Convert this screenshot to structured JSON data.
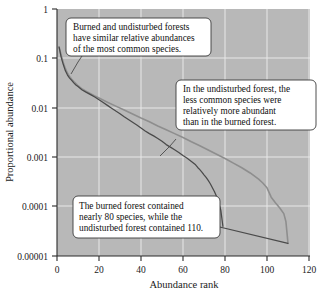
{
  "chart_data": {
    "type": "line",
    "title": "",
    "xlabel": "Abundance rank",
    "ylabel": "Proportional abundance",
    "xlim": [
      0,
      120
    ],
    "ylim": [
      1e-05,
      1
    ],
    "yscale": "log",
    "grid": true,
    "legend_position": "none",
    "xticks": [
      "0",
      "20",
      "40",
      "60",
      "80",
      "100",
      "120"
    ],
    "xtick_values": [
      0,
      20,
      40,
      60,
      80,
      100,
      120
    ],
    "yticks": [
      "1",
      "0.1",
      "0.01",
      "0.001",
      "0.0001",
      "0.00001"
    ],
    "ytick_values": [
      1,
      0.1,
      0.01,
      0.001,
      0.0001,
      1e-05
    ],
    "series": [
      {
        "name": "Burned forest",
        "color": "#4a4a4a",
        "n_species": 79,
        "x": [
          1,
          2,
          3,
          4,
          5,
          6,
          7,
          8,
          9,
          10,
          12,
          14,
          16,
          18,
          20,
          22,
          24,
          26,
          28,
          30,
          32,
          34,
          36,
          38,
          40,
          42,
          44,
          46,
          48,
          50,
          52,
          54,
          56,
          58,
          60,
          62,
          64,
          66,
          67,
          68,
          69,
          70,
          71,
          72,
          73,
          74,
          75,
          76,
          77,
          78,
          79
        ],
        "y": [
          0.17,
          0.105,
          0.075,
          0.056,
          0.046,
          0.04,
          0.036,
          0.032,
          0.029,
          0.027,
          0.023,
          0.0205,
          0.0185,
          0.0165,
          0.0145,
          0.0128,
          0.0112,
          0.0098,
          0.0086,
          0.0076,
          0.0066,
          0.0058,
          0.0051,
          0.0045,
          0.0039,
          0.0034,
          0.003,
          0.0027,
          0.0024,
          0.0021,
          0.0018,
          0.0016,
          0.00142,
          0.00125,
          0.00108,
          0.00095,
          0.00082,
          0.0007,
          0.00062,
          0.00056,
          0.0005,
          0.00044,
          0.00039,
          0.00034,
          0.00029,
          0.00024,
          0.0002,
          0.00016,
          0.00012,
          8.5e-05,
          4e-05
        ]
      },
      {
        "name": "Undisturbed forest",
        "color": "#8e8e8e",
        "n_species": 110,
        "x": [
          1,
          2,
          3,
          4,
          5,
          6,
          7,
          8,
          9,
          10,
          12,
          14,
          16,
          18,
          20,
          24,
          28,
          32,
          36,
          40,
          44,
          48,
          52,
          56,
          60,
          64,
          68,
          72,
          76,
          80,
          84,
          88,
          92,
          96,
          98,
          100,
          102,
          104,
          106,
          108,
          109,
          110
        ],
        "y": [
          0.17,
          0.115,
          0.082,
          0.062,
          0.05,
          0.043,
          0.038,
          0.034,
          0.031,
          0.028,
          0.024,
          0.0215,
          0.0193,
          0.0174,
          0.0158,
          0.013,
          0.0108,
          0.009,
          0.0075,
          0.0062,
          0.0052,
          0.0043,
          0.0036,
          0.003,
          0.0025,
          0.00205,
          0.0017,
          0.0014,
          0.00115,
          0.00094,
          0.00076,
          0.00061,
          0.00048,
          0.00036,
          0.0003,
          0.00024,
          0.000155,
          0.00012,
          9.5e-05,
          7.2e-05,
          5e-05,
          1.8e-05
        ]
      },
      {
        "name": "Undisturbed tail segment",
        "color": "#4a4a4a",
        "x": [
          76,
          110
        ],
        "y": [
          4e-05,
          1.8e-05
        ]
      }
    ],
    "annotations": [
      {
        "id": "callout-common-species",
        "lines": [
          "Burned and undisturbed forests",
          "have similar relative abundances",
          "of the most common species."
        ]
      },
      {
        "id": "callout-less-common-species",
        "lines": [
          "In the undisturbed forest, the",
          "less common species were",
          "relatively more abundant",
          "than in the burned forest."
        ]
      },
      {
        "id": "callout-species-counts",
        "lines": [
          "The burned forest contained",
          "nearly 80 species, while the",
          "undisturbed forest contained 110."
        ]
      }
    ]
  },
  "colors": {
    "plot_background": "#b8b8b8",
    "gridline": "#e8e8e8",
    "axis": "#2b2b2b",
    "burned_series": "#4a4a4a",
    "undisturbed_series": "#8e8e8e",
    "callout_fill": "#ffffff",
    "callout_border": "#3a3a3a"
  }
}
